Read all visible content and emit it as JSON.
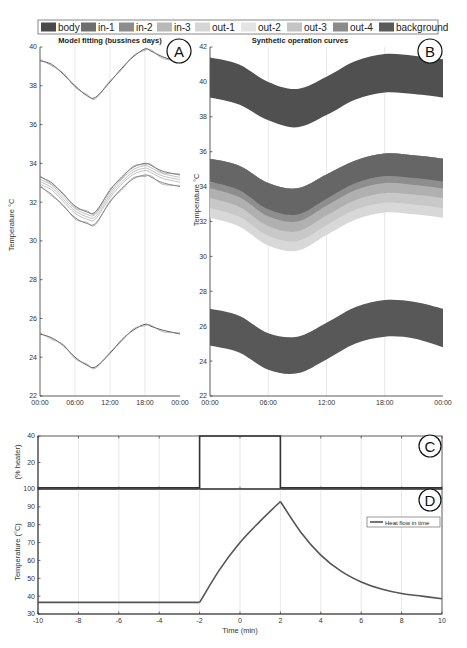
{
  "legend": {
    "items": [
      {
        "label": "body",
        "color": "#4a4a4a"
      },
      {
        "label": "in-1",
        "color": "#6e6e6e"
      },
      {
        "label": "in-2",
        "color": "#8c8c8c"
      },
      {
        "label": "in-3",
        "color": "#b8b8b8"
      },
      {
        "label": "out-1",
        "color": "#d6d6d6"
      },
      {
        "label": "out-2",
        "color": "#e4e4e4"
      },
      {
        "label": "out-3",
        "color": "#c4c4c4"
      },
      {
        "label": "out-4",
        "color": "#8a8a8a"
      },
      {
        "label": "background",
        "color": "#5a5a5a"
      }
    ]
  },
  "panels": {
    "A": {
      "badge": "A",
      "title": "Model fitting (bussines days)"
    },
    "B": {
      "badge": "B",
      "title": "Synthetic operation curves",
      "ylabel": "Temperature °C"
    },
    "C": {
      "badge": "C",
      "ylabel": "(% heater)"
    },
    "D": {
      "badge": "D",
      "ylabel": "Temperature (°C)",
      "xlabel": "Time (min)",
      "legend": "Heat flow in time"
    }
  },
  "chart_data": [
    {
      "id": "A",
      "type": "line",
      "title": "Model fitting (bussines days)",
      "xlabel": "",
      "ylabel": "Temperature °C",
      "x_ticks": [
        "00:00",
        "06:00",
        "12:00",
        "18:00",
        "00:00"
      ],
      "y_ticks": [
        22,
        24,
        26,
        28,
        30,
        32,
        34,
        36,
        38,
        40
      ],
      "ylim": [
        22,
        40
      ],
      "grid": "vertical",
      "x_hours": [
        0,
        2,
        4,
        6,
        8,
        9.5,
        12,
        14,
        16,
        18,
        19,
        21,
        24
      ],
      "series": [
        {
          "name": "body (measured & fit)",
          "values": [
            39.3,
            39.1,
            38.6,
            38.0,
            37.5,
            37.4,
            38.2,
            38.9,
            39.5,
            39.9,
            39.8,
            39.5,
            39.2
          ]
        },
        {
          "name": "in/out group upper",
          "values": [
            33.3,
            33.0,
            32.4,
            31.8,
            31.5,
            31.5,
            32.6,
            33.3,
            33.8,
            34.0,
            33.9,
            33.6,
            33.4
          ]
        },
        {
          "name": "in/out group lower",
          "values": [
            32.8,
            32.4,
            31.8,
            31.2,
            30.9,
            30.9,
            32.0,
            32.7,
            33.2,
            33.4,
            33.3,
            33.0,
            32.8
          ]
        },
        {
          "name": "background (measured & fit)",
          "values": [
            25.2,
            25.0,
            24.6,
            24.0,
            23.6,
            23.5,
            24.2,
            24.9,
            25.4,
            25.7,
            25.6,
            25.4,
            25.2
          ]
        }
      ]
    },
    {
      "id": "B",
      "type": "area",
      "title": "Synthetic operation curves",
      "xlabel": "",
      "ylabel": "Temperature °C",
      "x_ticks": [
        "00:00",
        "06:00",
        "12:00",
        "18:00",
        "00:00"
      ],
      "y_ticks": [
        22,
        24,
        26,
        28,
        30,
        32,
        34,
        36,
        38,
        40,
        42
      ],
      "ylim": [
        22,
        42
      ],
      "grid": "vertical",
      "x_hours": [
        0,
        3,
        6,
        9,
        12,
        15,
        18,
        21,
        24
      ],
      "series": [
        {
          "name": "body",
          "upper": [
            41.4,
            41.0,
            40.0,
            39.6,
            40.3,
            41.2,
            41.6,
            41.5,
            41.3
          ],
          "lower": [
            39.1,
            38.7,
            37.8,
            37.4,
            38.1,
            39.0,
            39.4,
            39.3,
            39.1
          ]
        },
        {
          "name": "in/out bands",
          "upper": [
            35.6,
            35.2,
            34.2,
            33.9,
            34.7,
            35.5,
            35.9,
            35.8,
            35.6
          ],
          "lower": [
            32.7,
            32.2,
            31.1,
            30.8,
            31.7,
            32.6,
            33.0,
            32.9,
            32.7
          ]
        },
        {
          "name": "background",
          "upper": [
            27.0,
            26.6,
            25.6,
            25.4,
            26.2,
            27.1,
            27.5,
            27.4,
            27.0
          ],
          "lower": [
            24.9,
            24.5,
            23.5,
            23.3,
            24.1,
            25.0,
            25.4,
            25.3,
            24.8
          ]
        }
      ]
    },
    {
      "id": "C",
      "type": "line",
      "title": "",
      "xlabel": "",
      "ylabel": "(% heater)",
      "y_ticks": [
        20,
        40
      ],
      "ylim": [
        0,
        40
      ],
      "x": [
        -10,
        -2,
        -2,
        2,
        2,
        10
      ],
      "values": [
        0,
        0,
        40,
        40,
        0,
        0
      ]
    },
    {
      "id": "D",
      "type": "line",
      "title": "",
      "xlabel": "Time (min)",
      "ylabel": "Temperature (°C)",
      "x_ticks": [
        -10,
        -8,
        -6,
        -4,
        -2,
        0,
        2,
        4,
        6,
        8,
        10
      ],
      "y_ticks": [
        30,
        40,
        50,
        60,
        70,
        80,
        90,
        100
      ],
      "xlim": [
        -10,
        10
      ],
      "ylim": [
        30,
        100
      ],
      "grid": "vertical",
      "legend": [
        "Heat flow in time"
      ],
      "legend_position": "upper right",
      "x": [
        -10,
        -2,
        -1,
        0,
        1,
        2,
        3,
        4,
        5,
        6,
        7,
        8,
        9,
        10
      ],
      "values": [
        36.5,
        36.5,
        55,
        70,
        82,
        93,
        76,
        63,
        54,
        48,
        44,
        41.5,
        40,
        38.5
      ]
    }
  ]
}
